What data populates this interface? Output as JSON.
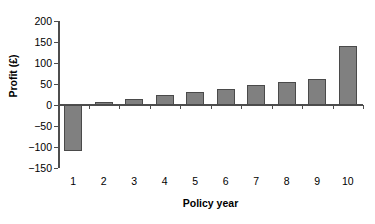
{
  "chart_data": {
    "type": "bar",
    "title": "",
    "subtitle": "",
    "xlabel": "Policy year",
    "ylabel": "Profit (£)",
    "categories": [
      "1",
      "2",
      "3",
      "4",
      "5",
      "6",
      "7",
      "8",
      "9",
      "10"
    ],
    "values": [
      -110,
      7,
      15,
      24,
      30,
      37,
      47,
      55,
      62,
      140
    ],
    "series": [
      {
        "name": "Profit",
        "values": [
          -110,
          7,
          15,
          24,
          30,
          37,
          47,
          55,
          62,
          140
        ]
      }
    ],
    "ylim": [
      -150,
      200
    ],
    "ytick_values": [
      200,
      150,
      100,
      50,
      0,
      -50,
      -100,
      -150
    ],
    "ytick_labels": [
      "200",
      "150",
      "100",
      "50",
      "0",
      "−50",
      "−100",
      "−150"
    ],
    "ytick_interval": 50,
    "xlim_categories": 10,
    "grid": false,
    "legend": false,
    "legend_position": "none",
    "bar_color": "#808080",
    "bar_edge_color": "#4a4a4a",
    "axis_color": "#4d4d4d",
    "background_color": "#ffffff",
    "text_color": "#000000",
    "annotations": []
  }
}
